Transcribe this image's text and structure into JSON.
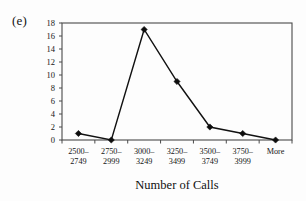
{
  "figure": {
    "panel_label": "(e)"
  },
  "chart_data": {
    "type": "line",
    "title": "",
    "xlabel": "Number of Calls",
    "ylabel": "",
    "categories": [
      "2500–\n2749",
      "2750–\n2999",
      "3000–\n3249",
      "3250–\n3499",
      "3500–\n3749",
      "3750–\n3999",
      "More"
    ],
    "category_lines": [
      [
        "2500–",
        "2749"
      ],
      [
        "2750–",
        "2999"
      ],
      [
        "3000–",
        "3249"
      ],
      [
        "3250–",
        "3499"
      ],
      [
        "3500–",
        "3749"
      ],
      [
        "3750–",
        "3999"
      ],
      [
        "More",
        ""
      ]
    ],
    "values": [
      1,
      0,
      17,
      9,
      2,
      1,
      0
    ],
    "ylim": [
      0,
      18
    ],
    "ytick_values": [
      0,
      2,
      4,
      6,
      8,
      10,
      12,
      14,
      16,
      18
    ],
    "ytick_labels": [
      "0",
      "2",
      "4",
      "6",
      "8",
      "10",
      "12",
      "14",
      "16",
      "18"
    ],
    "grid": false,
    "legend": false,
    "marker": "diamond",
    "line_color": "#111111",
    "marker_color": "#0d0d0d",
    "frame": true
  }
}
